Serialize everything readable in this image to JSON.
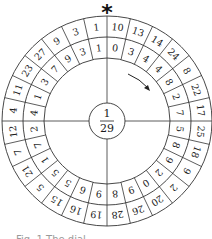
{
  "diagram": {
    "marker": "*",
    "hub": {
      "numerator": "1",
      "denominator": "29"
    },
    "segments_count": 28,
    "start": "top",
    "direction": "clockwise",
    "outer_ring": [
      10,
      13,
      14,
      24,
      8,
      22,
      17,
      25,
      18,
      9,
      2,
      20,
      26,
      28,
      19,
      16,
      15,
      5,
      21,
      7,
      12,
      4,
      11,
      23,
      27,
      9,
      3,
      1
    ],
    "inner_ring": [
      0,
      3,
      4,
      4,
      8,
      2,
      7,
      5,
      8,
      9,
      2,
      0,
      9,
      8,
      9,
      6,
      5,
      5,
      1,
      7,
      2,
      4,
      1,
      3,
      7,
      9,
      3,
      1
    ],
    "arrow": "clockwise-arrow",
    "colors": {
      "line": "#333333",
      "text": "#1a1a1a",
      "background": "#ffffff"
    }
  },
  "caption": "Fig. 1 The dial"
}
